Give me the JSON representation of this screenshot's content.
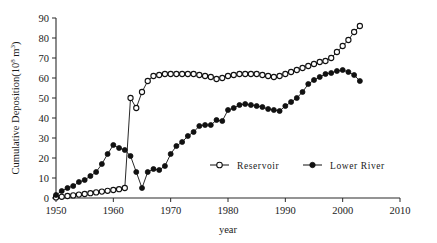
{
  "chart_data": {
    "type": "line",
    "title": "",
    "subtitle": "",
    "xlabel": "year",
    "ylabel": "Cumulative Deposition(10",
    "ylabel_exp1": "8",
    "ylabel_mid": " m",
    "ylabel_exp2": "3",
    "ylabel_end": ")",
    "ylabel_full": "Cumulative Deposition(10^8 m^3)",
    "xlim": [
      1950,
      2010
    ],
    "ylim": [
      0,
      90
    ],
    "xticks": [
      1950,
      1960,
      1970,
      1980,
      1990,
      2000,
      2010
    ],
    "yticks": [
      0,
      10,
      20,
      30,
      40,
      50,
      60,
      70,
      80,
      90
    ],
    "grid": false,
    "legend_position": "inside-center-bottom",
    "series": [
      {
        "name": "Reservoir",
        "marker": "open-circle",
        "x": [
          1950,
          1951,
          1952,
          1953,
          1954,
          1955,
          1956,
          1957,
          1958,
          1959,
          1960,
          1961,
          1962,
          1963,
          1964,
          1965,
          1966,
          1967,
          1968,
          1969,
          1970,
          1971,
          1972,
          1973,
          1974,
          1975,
          1976,
          1977,
          1978,
          1979,
          1980,
          1981,
          1982,
          1983,
          1984,
          1985,
          1986,
          1987,
          1988,
          1989,
          1990,
          1991,
          1992,
          1993,
          1994,
          1995,
          1996,
          1997,
          1998,
          1999,
          2000,
          2001,
          2002,
          2003
        ],
        "values": [
          0.3,
          0.6,
          1.0,
          1.3,
          1.7,
          2.0,
          2.4,
          2.8,
          3.2,
          3.6,
          4.0,
          4.4,
          5.0,
          50.0,
          45.0,
          53.0,
          58.5,
          61.0,
          61.5,
          62.0,
          62.0,
          62.0,
          62.0,
          62.0,
          62.0,
          61.5,
          61.0,
          60.5,
          59.5,
          60.0,
          61.0,
          61.5,
          62.0,
          62.0,
          62.0,
          62.0,
          61.5,
          61.0,
          60.5,
          61.0,
          62.0,
          63.0,
          64.0,
          65.0,
          66.0,
          67.0,
          68.0,
          68.5,
          70.0,
          73.0,
          76.0,
          79.0,
          83.0,
          86.0
        ]
      },
      {
        "name": "Lower River",
        "marker": "filled-circle",
        "x": [
          1950,
          1951,
          1952,
          1953,
          1954,
          1955,
          1956,
          1957,
          1958,
          1959,
          1960,
          1961,
          1962,
          1963,
          1964,
          1965,
          1966,
          1967,
          1968,
          1969,
          1970,
          1971,
          1972,
          1973,
          1974,
          1975,
          1976,
          1977,
          1978,
          1979,
          1980,
          1981,
          1982,
          1983,
          1984,
          1985,
          1986,
          1987,
          1988,
          1989,
          1990,
          1991,
          1992,
          1993,
          1994,
          1995,
          1996,
          1997,
          1998,
          1999,
          2000,
          2001,
          2002,
          2003
        ],
        "values": [
          1.5,
          3.5,
          5.0,
          6.0,
          8.0,
          9.0,
          11.0,
          13.0,
          17.0,
          22.0,
          26.5,
          25.0,
          24.0,
          21.0,
          13.0,
          5.0,
          13.0,
          14.5,
          14.0,
          16.0,
          22.0,
          26.0,
          28.0,
          31.0,
          33.0,
          36.0,
          36.5,
          36.5,
          39.0,
          38.5,
          44.0,
          45.0,
          46.5,
          47.0,
          46.5,
          46.0,
          45.5,
          44.5,
          44.0,
          43.5,
          46.0,
          48.0,
          50.0,
          53.0,
          57.0,
          59.0,
          60.5,
          62.0,
          62.5,
          63.5,
          64.0,
          63.0,
          61.5,
          58.5
        ]
      }
    ],
    "legend": [
      {
        "label": "Reservoir",
        "marker": "open-circle"
      },
      {
        "label": "Lower River",
        "marker": "filled-circle"
      }
    ]
  }
}
